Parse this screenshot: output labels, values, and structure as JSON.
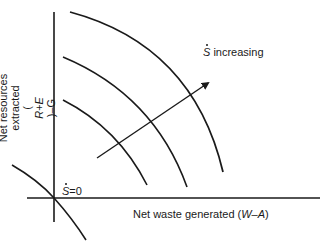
{
  "diagram": {
    "title": "",
    "y_axis": {
      "label_lines": [
        "Net resources",
        "extracted",
        "(R+E)–G"
      ],
      "line1": "Net resources",
      "line2": "extracted",
      "line3_prefix": "(",
      "line3_italic": "R+E",
      "line3_suffix": ")–G"
    },
    "x_axis": {
      "label_prefix": "Net waste generated (",
      "label_italic": "W–A",
      "label_suffix": ")"
    },
    "zero_curve_label": {
      "symbol": "S",
      "suffix": "=0"
    },
    "arrow_label": {
      "symbol": "S",
      "suffix": " increasing"
    },
    "curves": [
      {
        "name": "S-dot = 0",
        "level": 0
      },
      {
        "name": "iso-S-dot curve 1",
        "level": 1
      },
      {
        "name": "iso-S-dot curve 2",
        "level": 2
      },
      {
        "name": "iso-S-dot curve 3",
        "level": 3
      }
    ],
    "colors": {
      "line": "#1a1a1a",
      "background": "#ffffff"
    }
  }
}
